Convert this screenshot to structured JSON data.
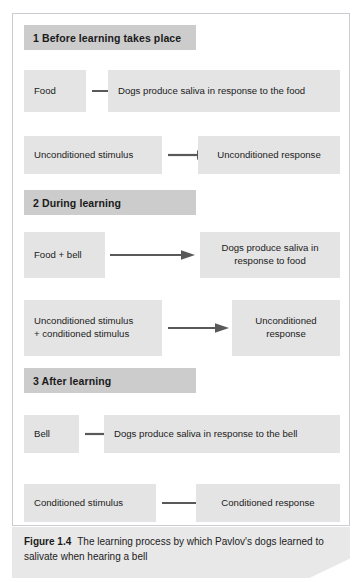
{
  "figure": {
    "caption_label": "Figure 1.4",
    "caption_text": "The learning process by which Pavlov's dogs learned to salivate when hearing a bell"
  },
  "sections": [
    {
      "header": "1 Before learning takes place",
      "rows": [
        {
          "source": "Food",
          "target": "Dogs produce saliva in response to the food"
        },
        {
          "source": "Unconditioned stimulus",
          "target": "Unconditioned response"
        }
      ]
    },
    {
      "header": "2 During learning",
      "rows": [
        {
          "source": "Food + bell",
          "target": "Dogs produce saliva in\nresponse to food"
        },
        {
          "source": "Unconditioned stimulus\n+ conditioned stimulus",
          "target": "Unconditioned\nresponse"
        }
      ]
    },
    {
      "header": "3 After learning",
      "rows": [
        {
          "source": "Bell",
          "target": "Dogs produce saliva in response to the bell"
        },
        {
          "source": "Conditioned stimulus",
          "target": "Conditioned response"
        }
      ]
    }
  ],
  "colors": {
    "header_bar": "#cccccc",
    "content_box": "#e4e4e4",
    "arrow": "#595959",
    "frame_border": "#c9cdd2",
    "caption_band": "#e8e8e8",
    "text": "#1b1b1b"
  }
}
